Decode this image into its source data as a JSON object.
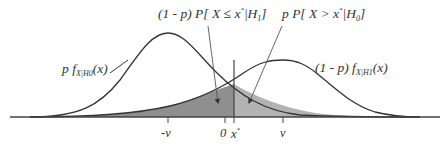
{
  "labels": {
    "left_curve": {
      "prefix": "p f",
      "sub": "X|H0",
      "suffix": "(x)"
    },
    "right_curve": {
      "prefix": "(1 - p) f",
      "sub": "X|H1",
      "suffix": "(x)"
    },
    "left_area": {
      "prefix": "(1 - p) P[ X ≤ x",
      "sup": "*",
      "mid": "|H",
      "sub": "1",
      "suffix": "]"
    },
    "right_area": {
      "prefix": "p P[ X > x",
      "sup": "*",
      "mid": "|H",
      "sub": "0",
      "suffix": "]"
    }
  },
  "axis_ticks": [
    {
      "label": "-v",
      "x": 168
    },
    {
      "label": "0",
      "x": 225
    },
    {
      "label": "x",
      "sup": "*",
      "x": 234
    },
    {
      "label": "v",
      "x": 283
    }
  ],
  "colors": {
    "curve": "#333333",
    "axis": "#444444",
    "shade_dark": "#8f8f8f",
    "shade_light": "#b3b3b3"
  }
}
